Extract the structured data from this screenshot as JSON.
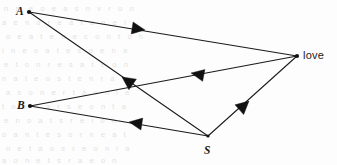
{
  "figure": {
    "width": 337,
    "height": 165,
    "background_color": "#fdfdfd",
    "line_color": "#1a1a1a"
  },
  "nodes": [
    {
      "id": "A",
      "label": "A",
      "style": "italic",
      "x": 29,
      "y": 12,
      "label_x": 16,
      "label_y": 6
    },
    {
      "id": "B",
      "label": "B",
      "style": "italic",
      "x": 30,
      "y": 106,
      "label_x": 17,
      "label_y": 100
    },
    {
      "id": "S",
      "label": "S",
      "style": "italic",
      "x": 208,
      "y": 136,
      "label_x": 204,
      "label_y": 145
    },
    {
      "id": "love",
      "label": "love",
      "style": "upright",
      "x": 297,
      "y": 56,
      "label_x": 303,
      "label_y": 50
    }
  ],
  "edges": [
    {
      "id": "a-to-love",
      "from": "A",
      "to": "love",
      "direction": "A → love",
      "arrow_x": 145,
      "arrow_y": 30,
      "arrow_angle": 19
    },
    {
      "id": "s-to-a",
      "from": "S",
      "to": "A",
      "direction": "S → A",
      "arrow_x": 122,
      "arrow_y": 77,
      "arrow_angle": 215
    },
    {
      "id": "love-to-b",
      "from": "love",
      "to": "B",
      "direction": "love → B",
      "arrow_x": 191,
      "arrow_y": 73,
      "arrow_angle": 190
    },
    {
      "id": "s-to-b",
      "from": "S",
      "to": "B",
      "direction": "S → B",
      "arrow_x": 129,
      "arrow_y": 122,
      "arrow_angle": 187
    },
    {
      "id": "s-to-love",
      "from": "S",
      "to": "love",
      "direction": "S → love",
      "arrow_x": 249,
      "arrow_y": 101,
      "arrow_angle": -41
    }
  ],
  "background_artifacts": {
    "description": "faint gray scanned page bleed-through text",
    "color": "#d9d9d9",
    "lines": [
      {
        "text": "n m  e  o   e a  s  n  v  r  o  n",
        "x": 4,
        "y": 8
      },
      {
        "text": "a  e  n   o  r e  a  t  o  n  e  i",
        "x": 2,
        "y": 22
      },
      {
        "text": "o e   a  t  e   n   e  c  o  n  t  o  h",
        "x": 6,
        "y": 36
      },
      {
        "text": "i  n  e  o   a  t   e  s  o  e  n  a",
        "x": 2,
        "y": 50
      },
      {
        "text": "e  t  o   n  r  e  s  a  t  e  o  n",
        "x": 4,
        "y": 64
      },
      {
        "text": "n  a  t   e  o  s  t  e  n  r  a",
        "x": 2,
        "y": 78
      },
      {
        "text": "a  s  o  n  e  r  t  a  o  n  i  e",
        "x": 6,
        "y": 92
      },
      {
        "text": "t  o  e  n  a  r  s  e  o  n  t  a",
        "x": 2,
        "y": 106
      },
      {
        "text": "e  n  o  a  t  s  r  e  i  o  n",
        "x": 4,
        "y": 120
      },
      {
        "text": "o  a  n  t  e  s  o  r  n  e  a  t",
        "x": 2,
        "y": 134
      },
      {
        "text": "n  e  t  a  o  s  r  e  o  n  i  a",
        "x": 6,
        "y": 148
      },
      {
        "text": "a  o  n  e  t  s  r  a  e  o  n",
        "x": 2,
        "y": 158
      }
    ]
  }
}
